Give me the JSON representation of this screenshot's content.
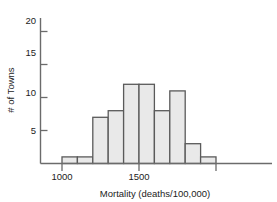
{
  "chart_data": {
    "type": "bar",
    "title": "",
    "subtitle": "",
    "xlabel": "Mortality (deaths/100,000)",
    "ylabel": "# of Towns",
    "xlim": [
      900,
      2060
    ],
    "ylim": [
      0,
      21.5
    ],
    "grid": false,
    "legend": null,
    "bin_width": 100,
    "bin_starts": [
      1000,
      1100,
      1200,
      1300,
      1400,
      1500,
      1600,
      1700,
      1800,
      1900
    ],
    "categories": [
      "1000-1100",
      "1100-1200",
      "1200-1300",
      "1300-1400",
      "1400-1500",
      "1500-1600",
      "1600-1700",
      "1700-1800",
      "1800-1900",
      "1900-2000"
    ],
    "values": [
      1,
      1,
      7,
      8,
      12,
      12,
      8,
      11,
      3,
      1
    ],
    "x_ticks": [
      1000,
      1500,
      2000
    ],
    "x_tick_labels": [
      "1000",
      "1500",
      ""
    ],
    "y_ticks": [
      5,
      10,
      15,
      20
    ],
    "y_tick_labels": [
      "5",
      "10",
      "15",
      "20"
    ],
    "bar_fill_color": "#e9e9e9",
    "bar_edge_color": "#5a5a5a",
    "axis_color": "#6b6b6b",
    "text_color": "#1c1c1c"
  },
  "axes": {
    "x_title": "Mortality (deaths/100,000)",
    "y_title": "# of Towns",
    "x_tick_1": "1000",
    "x_tick_2": "1500",
    "y_tick_1": "5",
    "y_tick_2": "10",
    "y_tick_3": "15",
    "y_tick_4": "20"
  }
}
